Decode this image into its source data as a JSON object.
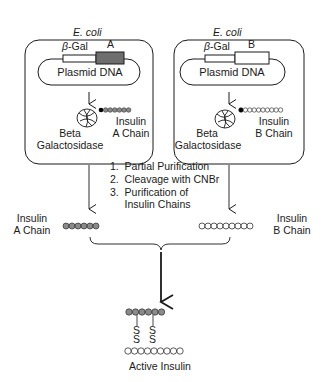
{
  "diagram": {
    "colors": {
      "stroke": "#1a1a1a",
      "a_chain_fill": "#8a8a8a",
      "a_gene_fill": "#6e6e6e",
      "b_chain_fill": "#ffffff",
      "linker_bead": "#000000"
    },
    "left_panel": {
      "organism": "E. coli",
      "promoter_label": "β-Gal",
      "gene_label": "A",
      "plasmid_label": "Plasmid DNA",
      "protein_label_line1": "Beta",
      "protein_label_line2": "Galactosidase",
      "chain_label_line1": "Insulin",
      "chain_label_line2": "A Chain",
      "bead_count": 6
    },
    "right_panel": {
      "organism": "E. coli",
      "promoter_label": "β-Gal",
      "gene_label": "B",
      "plasmid_label": "Plasmid DNA",
      "protein_label_line1": "Beta",
      "protein_label_line2": "Galactosidase",
      "chain_label_line1": "Insulin",
      "chain_label_line2": "B Chain",
      "bead_count": 9
    },
    "steps": [
      "1.  Partial Purification",
      "2.  Cleavage with CNBr",
      "3.  Purification of",
      "     Insulin Chains"
    ],
    "purified": {
      "a_label_line1": "Insulin",
      "a_label_line2": "A Chain",
      "b_label_line1": "Insulin",
      "b_label_line2": "B Chain",
      "a_bead_count": 6,
      "b_bead_count": 9
    },
    "product": {
      "disulfide_atom": "S",
      "bridge_count": 2,
      "label": "Active Insulin"
    }
  }
}
